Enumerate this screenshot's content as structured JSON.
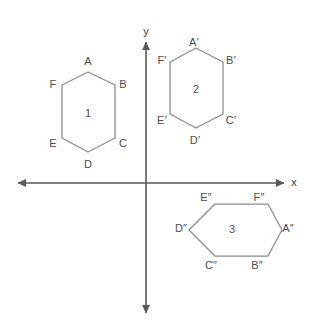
{
  "figure": {
    "type": "coordinate-plane-hexagons",
    "background_color": "#ffffff",
    "stroke_color": "#808080",
    "axis_color": "#595959",
    "text_color": "#4d4d4d",
    "width": 309,
    "height": 324
  },
  "axes": {
    "x_axis": {
      "label": "x",
      "label_x": 294,
      "label_y": 182,
      "y": 183,
      "x_start": 18,
      "x_end": 284,
      "arrows": "both"
    },
    "y_axis": {
      "label": "y",
      "label_x": 146,
      "label_y": 31,
      "x": 146,
      "y_start": 42,
      "y_end": 313,
      "arrows": "both"
    },
    "origin": {
      "x": 146,
      "y": 183
    }
  },
  "shapes": [
    {
      "id": "hexagon-1",
      "number": "1",
      "number_x": 88,
      "number_y": 113,
      "quadrant": "II",
      "orientation": "vertical",
      "points": "88,72 115,85 115,138 88,152 62,138 62,85",
      "vertices": [
        {
          "name": "A",
          "label": "A",
          "x": 88,
          "y": 67,
          "lx": 88,
          "ly": 61
        },
        {
          "name": "B",
          "label": "B",
          "x": 115,
          "y": 85,
          "lx": 123,
          "ly": 84
        },
        {
          "name": "C",
          "label": "C",
          "x": 115,
          "y": 138,
          "lx": 123,
          "ly": 143
        },
        {
          "name": "D",
          "label": "D",
          "x": 88,
          "y": 152,
          "lx": 88,
          "ly": 164
        },
        {
          "name": "E",
          "label": "E",
          "x": 62,
          "y": 138,
          "lx": 53,
          "ly": 143
        },
        {
          "name": "F",
          "label": "F",
          "x": 62,
          "y": 85,
          "lx": 53,
          "ly": 84
        }
      ]
    },
    {
      "id": "hexagon-2",
      "number": "2",
      "number_x": 196,
      "number_y": 89,
      "quadrant": "I",
      "orientation": "vertical",
      "points": "196,48 223,62 223,114 196,128 170,114 170,62",
      "vertices": [
        {
          "name": "A-prime",
          "label": "A′",
          "x": 196,
          "y": 48,
          "lx": 194,
          "ly": 42
        },
        {
          "name": "B-prime",
          "label": "B′",
          "x": 223,
          "y": 62,
          "lx": 231,
          "ly": 60
        },
        {
          "name": "C-prime",
          "label": "C′",
          "x": 223,
          "y": 114,
          "lx": 231,
          "ly": 120
        },
        {
          "name": "D-prime",
          "label": "D′",
          "x": 196,
          "y": 128,
          "lx": 195,
          "ly": 140
        },
        {
          "name": "E-prime",
          "label": "E′",
          "x": 170,
          "y": 114,
          "lx": 162,
          "ly": 120
        },
        {
          "name": "F-prime",
          "label": "F′",
          "x": 170,
          "y": 62,
          "lx": 162,
          "ly": 60
        }
      ]
    },
    {
      "id": "hexagon-3",
      "number": "3",
      "number_x": 232,
      "number_y": 229,
      "quadrant": "IV",
      "orientation": "horizontal",
      "points": "215,204 268,204 282,230 268,256 215,256 189,230",
      "vertices": [
        {
          "name": "E-double-prime",
          "label": "E″",
          "x": 215,
          "y": 204,
          "lx": 206,
          "ly": 197
        },
        {
          "name": "F-double-prime",
          "label": "F″",
          "x": 268,
          "y": 204,
          "lx": 259,
          "ly": 197
        },
        {
          "name": "A-double-prime",
          "label": "A″",
          "x": 282,
          "y": 230,
          "lx": 288,
          "ly": 228
        },
        {
          "name": "B-double-prime",
          "label": "B″",
          "x": 268,
          "y": 256,
          "lx": 257,
          "ly": 265
        },
        {
          "name": "C-double-prime",
          "label": "C″",
          "x": 215,
          "y": 256,
          "lx": 211,
          "ly": 265
        },
        {
          "name": "D-double-prime",
          "label": "D″",
          "x": 189,
          "y": 230,
          "lx": 181,
          "ly": 228
        }
      ]
    }
  ]
}
